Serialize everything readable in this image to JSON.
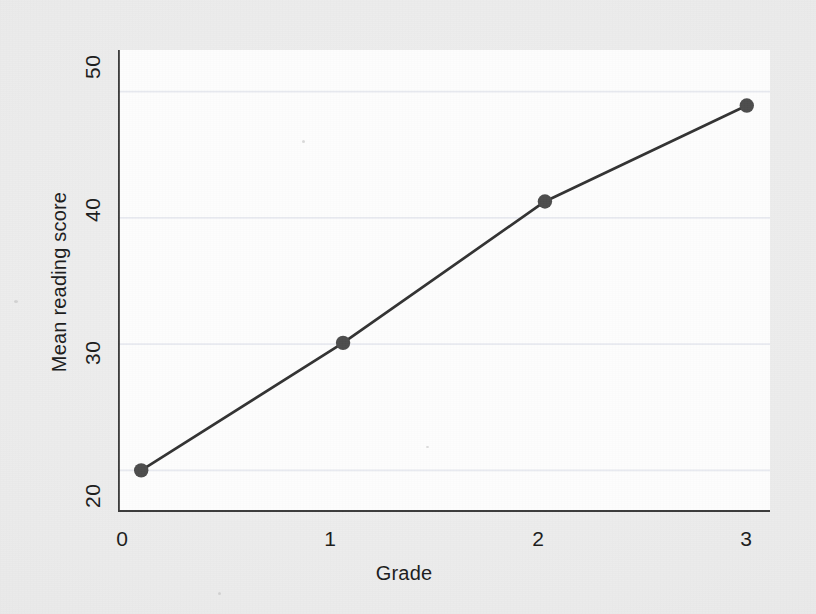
{
  "chart_data": {
    "type": "line",
    "title": "",
    "subtitle": "",
    "xlabel": "Grade",
    "ylabel": "Mean reading score",
    "x": [
      0,
      1,
      2,
      3
    ],
    "values": [
      20.0,
      30.1,
      41.3,
      48.9
    ],
    "series": [
      {
        "name": "Mean reading score",
        "values": [
          20.0,
          30.1,
          41.3,
          48.9
        ]
      }
    ],
    "categories": [
      "0",
      "1",
      "2",
      "3"
    ],
    "xtick_labels": [
      "0",
      "1",
      "2",
      "3"
    ],
    "ytick_labels": [
      "20",
      "30",
      "40",
      "50"
    ],
    "ytick_values": [
      20,
      30,
      40,
      50
    ],
    "xtick_values": [
      0,
      1,
      2,
      3
    ],
    "xlim": [
      -0.115,
      3.115
    ],
    "ylim": [
      16.7,
      53.3
    ],
    "grid": true,
    "grid_axis": "y",
    "legend": false,
    "legend_position": "none",
    "marker": "circle",
    "marker_color": "#4d4d4d",
    "line_color": "#333333",
    "annotations": []
  },
  "axes": {
    "y_title": "Mean reading score",
    "x_title": "Grade",
    "y_ticks": [
      "50",
      "40",
      "30",
      "20"
    ],
    "x_ticks": [
      "0",
      "1",
      "2",
      "3"
    ]
  },
  "colors": {
    "page_background": "#ececec",
    "plot_background": "#fdfdfd",
    "axis": "#3a3a3a",
    "gridline": "#e8eaf0",
    "line": "#333333",
    "marker": "#4d4d4d",
    "text": "#1d1d1d"
  }
}
